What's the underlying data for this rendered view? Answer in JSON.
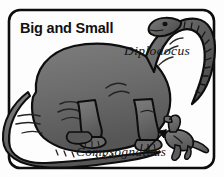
{
  "figure": {
    "title": "Big and Small",
    "frame": {
      "shape": "rounded-rectangle",
      "border_color": "#0d0d0d",
      "background_color": "#fdfdfd"
    },
    "labels": [
      {
        "id": "diplodocus",
        "text": "Diplodocus",
        "style": "italic-serif",
        "has_arrow": false
      },
      {
        "id": "compsognathus",
        "text": "Compsognathus",
        "style": "italic-serif",
        "has_arrow": true,
        "arrow_direction": "up-right"
      }
    ],
    "subjects": [
      {
        "id": "diplodocus",
        "name": "Diplodocus",
        "size": "big",
        "description": "large long-necked sauropod, body fills frame, head and neck arc over top-right, tail sweeps across bottom-left",
        "body_color": "#6e6e6e",
        "shadow_color": "#4a4a4a",
        "outline_color": "#0d0d0d"
      },
      {
        "id": "compsognathus",
        "name": "Compsognathus",
        "size": "small",
        "description": "tiny bipedal theropod standing beside the sauropod's foot at lower right",
        "body_color": "#6e6e6e",
        "shadow_color": "#4a4a4a",
        "outline_color": "#0d0d0d"
      }
    ],
    "colors": {
      "ink": "#0d0d0d",
      "dino_fill": "#6e6e6e",
      "dino_shade": "#565656",
      "dino_highlight": "#8a8a8a",
      "paper": "#fdfdfd"
    }
  }
}
